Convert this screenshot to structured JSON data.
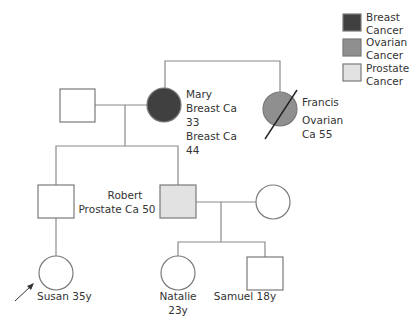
{
  "colors": {
    "breast": "#404040",
    "ovarian": "#8f8f8f",
    "prostate": "#e2e2e2",
    "unaffected": "#ffffff",
    "line": "#8a8a8a"
  },
  "legend": [
    {
      "label_line1": "Breast",
      "label_line2": "Cancer",
      "condition": "breast"
    },
    {
      "label_line1": "Ovarian",
      "label_line2": "Cancer",
      "condition": "ovarian"
    },
    {
      "label_line1": "Prostate",
      "label_line2": "Cancer",
      "condition": "prostate"
    }
  ],
  "individuals": {
    "grandfather": {
      "sex": "male",
      "affected": "none"
    },
    "mary": {
      "sex": "female",
      "affected": "breast",
      "lines": [
        "Mary",
        "Breast Ca",
        "33",
        "Breast Ca",
        "44"
      ]
    },
    "francis": {
      "sex": "female",
      "affected": "ovarian",
      "deceased": true,
      "lines": [
        "Francis",
        "Ovarian",
        "Ca 55"
      ]
    },
    "susans_father": {
      "sex": "male",
      "affected": "none"
    },
    "robert": {
      "sex": "male",
      "affected": "prostate",
      "lines": [
        "Robert",
        "Prostate Ca 50"
      ]
    },
    "roberts_spouse": {
      "sex": "female",
      "affected": "none"
    },
    "susan": {
      "sex": "female",
      "affected": "none",
      "proband": true,
      "label": "Susan 35y"
    },
    "natalie": {
      "sex": "female",
      "affected": "none",
      "lines": [
        "Natalie",
        "23y"
      ]
    },
    "samuel": {
      "sex": "male",
      "affected": "none",
      "label": "Samuel 18y"
    }
  }
}
